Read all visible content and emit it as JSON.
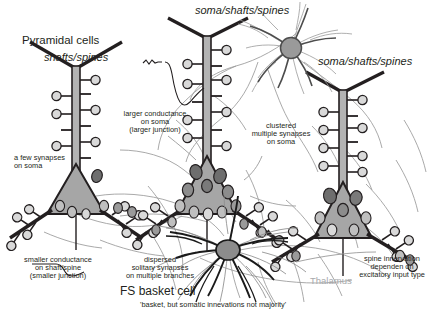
{
  "figure": {
    "title_pyramidal": "Pyramidal cells",
    "label_shafts_spines": "shafts/spines",
    "label_soma_shafts_spines_top": "soma/shafts/spines",
    "label_soma_shafts_spines_right": "soma/shafts/spines",
    "label_basket_cell": "FS basket cell",
    "label_basket_subtitle": "'basket, but somatic innevations not majority'",
    "label_thalamus": "Thalamus"
  },
  "annotations": {
    "few_synapses": "a few synapses\non soma",
    "larger_conductance": "larger conductance\non soma\n(larger junction)",
    "clustered_synapses": "clustered\nmultiple synapses\non soma",
    "smaller_conductance": "smaller conductance\non shaft/spine\n(smaller junction)",
    "dispersed_synapses": "dispersed\nsolitary synapses\non multiple branches",
    "spine_innervation": "spine innervation\ndependen on\nexcitatory input type"
  },
  "colors": {
    "ink": "#231f20",
    "soma_fill": "#a6a6a6",
    "dendrite_fill": "#b3b3b3",
    "spine_fill": "#d9d9d9",
    "bouton_dark": "#6e6e6e",
    "bouton_mid": "#9a9a9a",
    "axon_gray": "#8c8c8c",
    "thalamus_gray": "#a7a9ac",
    "basket_black": "#1a1a1a",
    "white": "#ffffff"
  },
  "icons": {
    "pyramidal_neuron": "pyramidal-neuron-icon",
    "basket_neuron": "basket-cell-icon",
    "spine": "dendritic-spine-icon",
    "bouton": "synaptic-bouton-icon",
    "trace": "conductance-trace-icon"
  }
}
